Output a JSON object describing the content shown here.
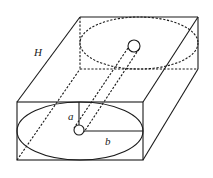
{
  "diagram": {
    "title": "",
    "labels": {
      "height": "H",
      "inner_radius": "a",
      "outer_radius": "b"
    },
    "shapes": {
      "box_front": {
        "x": 17,
        "y": 102,
        "w": 126,
        "h": 58
      },
      "box_back": {
        "x": 80,
        "y": 17,
        "w": 118,
        "h": 52
      },
      "front_ellipse": {
        "cx": 80,
        "cy": 131,
        "rx": 63,
        "ry": 29
      },
      "back_ellipse": {
        "cx": 139,
        "cy": 43,
        "rx": 59,
        "ry": 26
      },
      "front_hole": {
        "cx": 79,
        "cy": 130,
        "r": 5
      },
      "back_hole": {
        "cx": 134,
        "cy": 46,
        "r": 6
      }
    },
    "colors": {
      "stroke": "#1a1a1a",
      "background": "#ffffff"
    }
  }
}
